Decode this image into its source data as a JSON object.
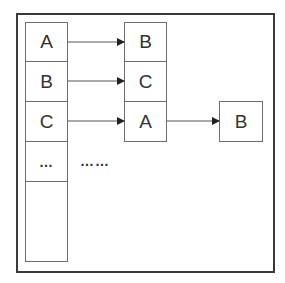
{
  "diagram": {
    "type": "hash-table-chaining",
    "left_column": {
      "cells": [
        "A",
        "B",
        "C",
        "…",
        ""
      ]
    },
    "middle_column": {
      "cells": [
        "B",
        "C",
        "A"
      ]
    },
    "right_box": {
      "label": "B"
    },
    "ellipsis_label": "……",
    "arrows": [
      {
        "from": "left.A",
        "to": "middle.B"
      },
      {
        "from": "left.B",
        "to": "middle.C"
      },
      {
        "from": "left.C",
        "to": "middle.A"
      },
      {
        "from": "middle.A",
        "to": "right.B"
      }
    ],
    "colors": {
      "frame": "#3a3a3a",
      "cell_border": "#6e6e6e",
      "text": "#333333",
      "background": "#ffffff"
    }
  }
}
